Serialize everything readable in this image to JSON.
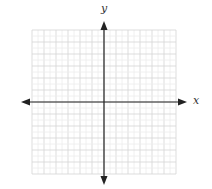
{
  "chart_data": {
    "type": "scatter",
    "title": "",
    "xlabel": "x",
    "ylabel": "y",
    "xlim": [
      -6,
      6
    ],
    "ylim": [
      -6,
      6
    ],
    "grid": true,
    "major_grid_step": 1,
    "minor_grid_subdivisions": 2,
    "axes_arrows": true,
    "series": [],
    "tick_labels": []
  },
  "labels": {
    "x_axis": "x",
    "y_axis": "y"
  },
  "colors": {
    "grid_major": "#d4d4d4",
    "grid_minor": "#ececec",
    "axis": "#222222"
  }
}
